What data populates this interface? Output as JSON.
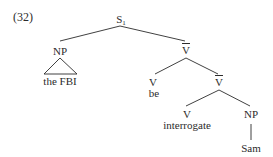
{
  "example_number": "(32)",
  "tree": {
    "root": {
      "label": "S",
      "subscript": "1"
    },
    "np_subject": {
      "label": "NP",
      "text": "the FBI",
      "triangle": true
    },
    "vbar_1": {
      "label": "V",
      "bar": true
    },
    "v_be": {
      "label": "V",
      "word": "be"
    },
    "vbar_2": {
      "label": "V",
      "bar": true
    },
    "v_interrogate": {
      "label": "V",
      "word": "interrogate"
    },
    "np_object": {
      "label": "NP",
      "word": "Sam"
    }
  },
  "colors": {
    "ink": "#2b2b2b",
    "background": "#ffffff"
  }
}
